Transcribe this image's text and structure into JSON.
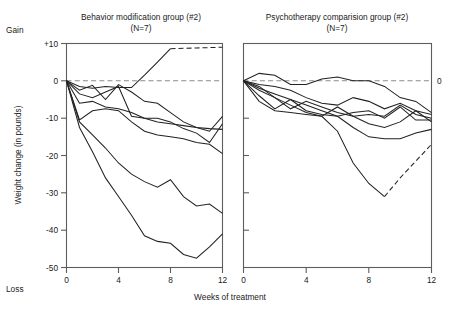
{
  "figure": {
    "axis_labels": {
      "y_title": "Weight change (in pounds)",
      "x_title": "Weeks of treatment",
      "gain_label": "Gain",
      "loss_label": "Loss"
    },
    "y_ticks": [
      "+10",
      "0",
      "-10",
      "-20",
      "-30",
      "-40",
      "-50"
    ],
    "x_ticks": [
      "0",
      "4",
      "8",
      "12"
    ],
    "right_zero_label": "0"
  },
  "chart_data": [
    {
      "type": "line",
      "panel": "left",
      "title": "Behavior modification group (#2)",
      "subtitle": "(N=7)",
      "xlabel": "Weeks of treatment",
      "ylabel": "Weight change (in pounds)",
      "xlim": [
        0,
        12
      ],
      "ylim": [
        -50,
        10
      ],
      "xticks": [
        0,
        4,
        8,
        12
      ],
      "yticks": [
        10,
        0,
        -10,
        -20,
        -30,
        -40,
        -50
      ],
      "grid": false,
      "legend": "none",
      "reference_line": {
        "y": 0,
        "style": "dashed"
      },
      "series": [
        {
          "name": "subject-1",
          "style": "solid-then-dashed",
          "dash_from_x": 8,
          "x": [
            0,
            1,
            2,
            3,
            4,
            5,
            6,
            7,
            8,
            9,
            10,
            11,
            12
          ],
          "values": [
            0,
            -1.5,
            -2.0,
            -1.5,
            -1.8,
            -1.8,
            1.5,
            5.0,
            8.6,
            8.7,
            8.8,
            8.9,
            9.0
          ]
        },
        {
          "name": "subject-2",
          "style": "solid",
          "x": [
            0,
            1,
            2,
            3,
            4,
            5,
            6,
            7,
            8,
            9,
            10,
            11,
            12
          ],
          "values": [
            0,
            -2.5,
            -1.2,
            -5.0,
            -1.0,
            -3.0,
            -5.5,
            -6.0,
            -8.5,
            -11.0,
            -12.5,
            -13.5,
            -9.5
          ]
        },
        {
          "name": "subject-3",
          "style": "solid",
          "x": [
            0,
            1,
            2,
            3,
            4,
            5,
            6,
            7,
            8,
            9,
            10,
            11,
            12
          ],
          "values": [
            0,
            -3.5,
            -4.5,
            -3.0,
            -1.5,
            -9.5,
            -10.0,
            -10.0,
            -11.0,
            -12.8,
            -14.0,
            -16.5,
            -11.5
          ]
        },
        {
          "name": "subject-4",
          "style": "solid",
          "x": [
            0,
            1,
            2,
            3,
            4,
            5,
            6,
            7,
            8,
            9,
            10,
            11,
            12
          ],
          "values": [
            0,
            -6.0,
            -5.5,
            -7.0,
            -7.5,
            -8.5,
            -10.0,
            -11.0,
            -11.5,
            -12.0,
            -12.5,
            -12.8,
            -13.0
          ]
        },
        {
          "name": "subject-5",
          "style": "solid",
          "x": [
            0,
            1,
            2,
            3,
            4,
            5,
            6,
            7,
            8,
            9,
            10,
            11,
            12
          ],
          "values": [
            0,
            -10.5,
            -8.0,
            -7.5,
            -8.0,
            -11.0,
            -13.5,
            -14.5,
            -15.0,
            -15.5,
            -16.5,
            -17.0,
            -19.5
          ]
        },
        {
          "name": "subject-6",
          "style": "solid",
          "x": [
            0,
            1,
            2,
            3,
            4,
            5,
            6,
            7,
            8,
            9,
            10,
            11,
            12
          ],
          "values": [
            0,
            -11.0,
            -14.5,
            -18.0,
            -22.0,
            -25.0,
            -27.0,
            -28.5,
            -26.5,
            -31.0,
            -33.5,
            -33.0,
            -35.5
          ]
        },
        {
          "name": "subject-7",
          "style": "solid",
          "x": [
            0,
            1,
            2,
            3,
            4,
            5,
            6,
            7,
            8,
            9,
            10,
            11,
            12
          ],
          "values": [
            0,
            -12.5,
            -19.0,
            -26.0,
            -31.0,
            -36.0,
            -41.5,
            -43.0,
            -43.5,
            -46.5,
            -47.5,
            -44.5,
            -41.0
          ]
        }
      ]
    },
    {
      "type": "line",
      "panel": "right",
      "title": "Psychotherapy comparision group (#2)",
      "subtitle": "(N=7)",
      "xlabel": "Weeks of treatment",
      "ylabel": "Weight change (in pounds)",
      "xlim": [
        0,
        12
      ],
      "ylim": [
        -50,
        10
      ],
      "xticks": [
        0,
        4,
        8,
        12
      ],
      "yticks": [
        10,
        0,
        -10,
        -20,
        -30,
        -40,
        -50
      ],
      "grid": false,
      "legend": "none",
      "reference_line": {
        "y": 0,
        "style": "dashed"
      },
      "series": [
        {
          "name": "subject-1",
          "style": "solid",
          "x": [
            0,
            1,
            2,
            3,
            4,
            5,
            6,
            7,
            8,
            9,
            10,
            11,
            12
          ],
          "values": [
            0,
            2.0,
            1.5,
            -1.0,
            -1.0,
            0.5,
            1.0,
            0.0,
            0.0,
            -1.5,
            -4.5,
            -5.5,
            -8.5
          ]
        },
        {
          "name": "subject-2",
          "style": "solid",
          "x": [
            0,
            1,
            2,
            3,
            4,
            5,
            6,
            7,
            8,
            9,
            10,
            11,
            12
          ],
          "values": [
            0,
            -1.0,
            -1.5,
            -2.5,
            -4.5,
            -6.0,
            -6.5,
            -4.5,
            -5.5,
            -7.5,
            -6.0,
            -8.0,
            -9.0
          ]
        },
        {
          "name": "subject-3",
          "style": "solid",
          "x": [
            0,
            1,
            2,
            3,
            4,
            5,
            6,
            7,
            8,
            9,
            10,
            11,
            12
          ],
          "values": [
            0,
            -1.5,
            -4.5,
            -7.5,
            -5.5,
            -7.0,
            -8.5,
            -9.5,
            -9.0,
            -9.5,
            -6.5,
            -9.0,
            -10.0
          ]
        },
        {
          "name": "subject-4",
          "style": "solid",
          "x": [
            0,
            1,
            2,
            3,
            4,
            5,
            6,
            7,
            8,
            9,
            10,
            11,
            12
          ],
          "values": [
            0,
            -4.0,
            -7.5,
            -5.0,
            -8.0,
            -9.0,
            -9.5,
            -8.5,
            -8.0,
            -10.0,
            -7.0,
            -10.5,
            -10.5
          ]
        },
        {
          "name": "subject-5",
          "style": "solid",
          "x": [
            0,
            1,
            2,
            3,
            4,
            5,
            6,
            7,
            8,
            9,
            10,
            11,
            12
          ],
          "values": [
            0,
            -5.5,
            -8.0,
            -8.5,
            -9.0,
            -9.5,
            -7.0,
            -9.5,
            -11.5,
            -12.5,
            -11.0,
            -8.0,
            -11.0
          ]
        },
        {
          "name": "subject-6",
          "style": "solid",
          "x": [
            0,
            1,
            2,
            3,
            4,
            5,
            6,
            7,
            8,
            9,
            10,
            11,
            12
          ],
          "values": [
            0,
            -2.0,
            -3.5,
            -5.0,
            -6.5,
            -8.0,
            -9.5,
            -12.5,
            -15.0,
            -15.5,
            -15.5,
            -14.0,
            -13.0
          ]
        },
        {
          "name": "subject-7",
          "style": "solid-then-dashed",
          "dash_from_x": 9,
          "x": [
            0,
            1,
            2,
            3,
            4,
            5,
            6,
            7,
            8,
            9,
            10,
            11,
            12
          ],
          "values": [
            0,
            -2.5,
            -4.5,
            -6.5,
            -8.5,
            -9.5,
            -13.5,
            -22.0,
            -27.5,
            -31.0,
            -26.0,
            -21.5,
            -17.0
          ]
        }
      ]
    }
  ]
}
